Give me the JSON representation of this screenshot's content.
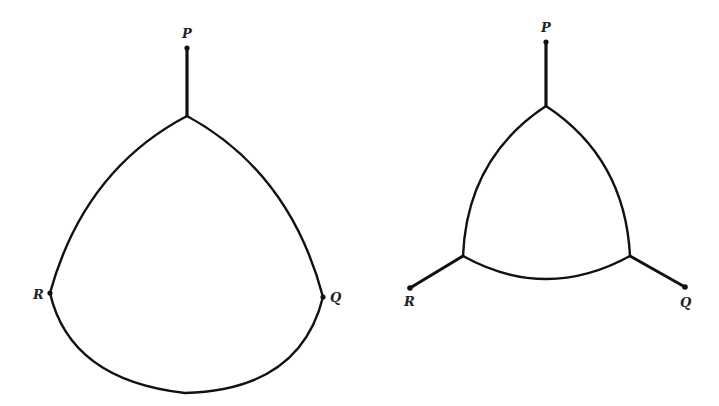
{
  "diagram": {
    "type": "steiner-network-comparison",
    "colors": {
      "stroke": "#111111",
      "label": "#222222",
      "background": "#ffffff"
    },
    "figures": [
      {
        "id": "left",
        "description": "Curved region with terminal P attached by stem; R and Q lie on the boundary",
        "terminals": [
          {
            "label": "P",
            "x": 187,
            "y": 48
          },
          {
            "label": "R",
            "x": 50,
            "y": 293
          },
          {
            "label": "Q",
            "x": 323,
            "y": 297
          }
        ],
        "junctions": [
          {
            "x": 187,
            "y": 116
          }
        ],
        "edges": [
          {
            "from": "P",
            "to": "J1",
            "kind": "straight"
          },
          {
            "from": "J1",
            "to": "R",
            "kind": "arc"
          },
          {
            "from": "J1",
            "to": "Q",
            "kind": "arc"
          },
          {
            "from": "R",
            "to": "Q",
            "kind": "arc"
          }
        ]
      },
      {
        "id": "right",
        "description": "Curved triangle with three spokes to terminals P, R, Q",
        "terminals": [
          {
            "label": "P",
            "x": 546,
            "y": 42
          },
          {
            "label": "R",
            "x": 410,
            "y": 288
          },
          {
            "label": "Q",
            "x": 685,
            "y": 287
          }
        ],
        "junctions": [
          {
            "x": 546,
            "y": 106
          },
          {
            "x": 463,
            "y": 256
          },
          {
            "x": 630,
            "y": 256
          }
        ],
        "edges": [
          {
            "from": "P",
            "to": "J1",
            "kind": "straight"
          },
          {
            "from": "R",
            "to": "J2",
            "kind": "straight"
          },
          {
            "from": "Q",
            "to": "J3",
            "kind": "straight"
          },
          {
            "from": "J1",
            "to": "J2",
            "kind": "arc"
          },
          {
            "from": "J1",
            "to": "J3",
            "kind": "arc"
          },
          {
            "from": "J2",
            "to": "J3",
            "kind": "arc"
          }
        ]
      }
    ],
    "labels": {
      "left_p": "P",
      "left_r": "R",
      "left_q": "Q",
      "right_p": "P",
      "right_r": "R",
      "right_q": "Q"
    }
  }
}
